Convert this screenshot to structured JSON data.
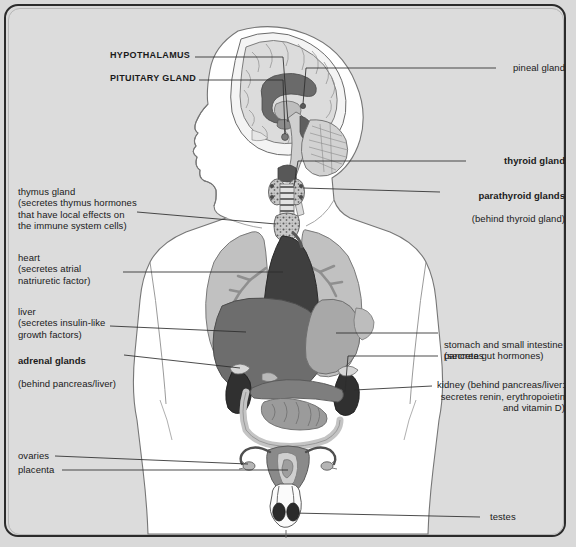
{
  "figure": {
    "background_color": "#dcdcdc",
    "frame_color": "#2b2b2b",
    "body_fill": "#ffffff",
    "outline_color": "#6e6e6e",
    "palette": {
      "dark": "#3f3f3f",
      "mid_dark": "#6d6d6d",
      "mid": "#8c8c8c",
      "light": "#b0b0b0",
      "pale": "#cfcfcf"
    }
  },
  "labels": {
    "hypothalamus": {
      "text": "HYPOTHALAMUS",
      "style": "bold-caps",
      "side": "left"
    },
    "pituitary": {
      "text": "PITUITARY GLAND",
      "style": "bold-caps",
      "side": "left"
    },
    "pineal": {
      "text": "pineal gland",
      "style": "regular",
      "side": "right"
    },
    "thyroid": {
      "text": "thyroid gland",
      "style": "bold",
      "side": "right"
    },
    "parathyroid": {
      "head": "parathyroid glands",
      "sub": "(behind thyroid gland)",
      "style": "bold",
      "side": "right"
    },
    "thymus": {
      "head": "thymus gland",
      "sub": "(secretes thymus hormones\nthat have local effects on\nthe immune system cells)",
      "style": "regular",
      "side": "left"
    },
    "heart": {
      "head": "heart",
      "sub": "(secretes atrial\nnatriuretic factor)",
      "style": "regular",
      "side": "left"
    },
    "liver": {
      "head": "liver",
      "sub": "(secretes insulin-like\ngrowth factors)",
      "style": "regular",
      "side": "left"
    },
    "adrenal": {
      "head": "adrenal glands",
      "sub": "(behind pancreas/liver)",
      "style": "bold",
      "side": "left"
    },
    "stomach": {
      "head": "stomach and small intestine",
      "sub": "(secrete gut hormones)",
      "style": "regular",
      "side": "right"
    },
    "pancreas": {
      "text": "pancreas",
      "style": "regular",
      "side": "right"
    },
    "kidney": {
      "text": "kidney (behind pancreas/liver:\nsecretes renin, erythropoietin\nand vitamin D)",
      "style": "regular",
      "side": "right"
    },
    "ovaries": {
      "text": "ovaries",
      "style": "regular",
      "side": "left"
    },
    "placenta": {
      "text": "placenta",
      "style": "regular",
      "side": "left"
    },
    "testes": {
      "text": "testes",
      "style": "regular",
      "side": "right"
    }
  },
  "organs": [
    {
      "name": "brain",
      "note": "mid-sagittal section in head"
    },
    {
      "name": "corpus-callosum"
    },
    {
      "name": "cerebellum"
    },
    {
      "name": "brainstem"
    },
    {
      "name": "pineal-gland"
    },
    {
      "name": "pituitary-gland"
    },
    {
      "name": "hypothalamus"
    },
    {
      "name": "thyroid-gland"
    },
    {
      "name": "parathyroid-glands"
    },
    {
      "name": "trachea"
    },
    {
      "name": "thymus-gland"
    },
    {
      "name": "lung-left"
    },
    {
      "name": "lung-right"
    },
    {
      "name": "heart"
    },
    {
      "name": "liver"
    },
    {
      "name": "stomach"
    },
    {
      "name": "pancreas"
    },
    {
      "name": "small-intestine"
    },
    {
      "name": "large-intestine"
    },
    {
      "name": "kidney-left"
    },
    {
      "name": "kidney-right"
    },
    {
      "name": "adrenal-gland-left"
    },
    {
      "name": "adrenal-gland-right"
    },
    {
      "name": "uterus"
    },
    {
      "name": "placenta"
    },
    {
      "name": "ovary-left"
    },
    {
      "name": "ovary-right"
    },
    {
      "name": "testis-left"
    },
    {
      "name": "testis-right"
    }
  ]
}
